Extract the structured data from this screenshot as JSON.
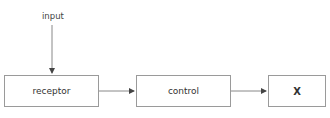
{
  "diagram": {
    "input_label": "input",
    "nodes": [
      {
        "id": "receptor",
        "label": "receptor"
      },
      {
        "id": "control",
        "label": "control"
      },
      {
        "id": "x",
        "label": "X"
      }
    ],
    "edges": [
      {
        "from": "input",
        "to": "receptor"
      },
      {
        "from": "receptor",
        "to": "control"
      },
      {
        "from": "control",
        "to": "x"
      }
    ],
    "colors": {
      "stroke": "#9a9a9a",
      "arrow": "#444444"
    }
  }
}
